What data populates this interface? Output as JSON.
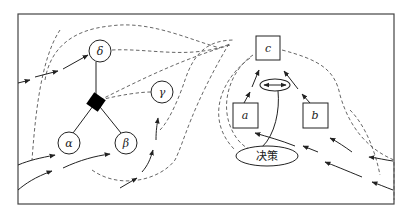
{
  "diagram": {
    "left_graph": {
      "nodes": [
        {
          "id": "delta",
          "label": "δ",
          "shape": "circle"
        },
        {
          "id": "gamma",
          "label": "γ",
          "shape": "circle"
        },
        {
          "id": "alpha",
          "label": "α",
          "shape": "circle"
        },
        {
          "id": "beta",
          "label": "β",
          "shape": "circle"
        },
        {
          "id": "junction",
          "label": "",
          "shape": "filled-diamond"
        }
      ]
    },
    "right_graph": {
      "nodes": [
        {
          "id": "c",
          "label": "c",
          "shape": "square"
        },
        {
          "id": "a",
          "label": "a",
          "shape": "square"
        },
        {
          "id": "b",
          "label": "b",
          "shape": "square"
        },
        {
          "id": "switch",
          "label": "",
          "shape": "ellipse-with-double-arrow"
        },
        {
          "id": "decision",
          "label": "决策",
          "shape": "ellipse"
        }
      ]
    },
    "colors": {
      "stroke": "#222222",
      "dashed": "#555555",
      "fill_node": "#000000",
      "background": "#ffffff"
    }
  }
}
